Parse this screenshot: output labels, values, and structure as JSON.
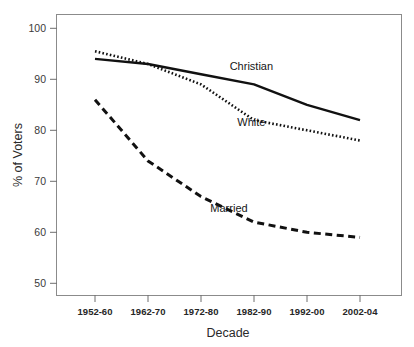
{
  "chart_data": {
    "type": "line",
    "title": "",
    "xlabel": "Decade",
    "ylabel": "% of Voters",
    "categories": [
      "1952-60",
      "1962-70",
      "1972-80",
      "1982-90",
      "1992-00",
      "2002-04"
    ],
    "ylim": [
      48,
      101
    ],
    "yticks": [
      50,
      60,
      70,
      80,
      90,
      100
    ],
    "ytick_labels": [
      "50",
      "60",
      "70",
      "80",
      "90",
      "100"
    ],
    "grid": false,
    "legend": "inline-annotations",
    "series": [
      {
        "name": "Christian",
        "style": "solid",
        "color": "#111111",
        "values": [
          94,
          93,
          91,
          89,
          85,
          82
        ],
        "label_x_category": "1982-90",
        "label_value": 93.5
      },
      {
        "name": "White",
        "style": "dotted",
        "color": "#111111",
        "values": [
          95.5,
          93,
          89,
          82,
          80,
          78
        ],
        "label_x_category": "1982-90",
        "label_value": 79.5
      },
      {
        "name": "Married",
        "style": "dashed",
        "color": "#111111",
        "values": [
          86,
          74,
          67,
          62,
          60,
          59
        ],
        "label_x_category": "1982-90",
        "label_value": 57.5
      }
    ],
    "annotations": [
      {
        "text": "Christian",
        "x": 0.565,
        "y": 0.195
      },
      {
        "text": "White",
        "x": 0.565,
        "y": 0.395
      },
      {
        "text": "Married",
        "x": 0.5,
        "y": 0.705
      }
    ]
  },
  "axes": {
    "y_axis_title": "% of Voters",
    "x_axis_title": "Decade"
  }
}
